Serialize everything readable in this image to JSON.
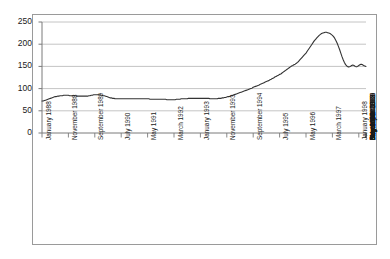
{
  "chart_data": {
    "type": "line",
    "title": "",
    "subtitle": "",
    "xlabel": "",
    "ylabel": "",
    "ylim": [
      0,
      250
    ],
    "yticks": [
      0,
      50,
      100,
      150,
      200,
      250
    ],
    "ytick_labels": [
      "0",
      "50",
      "100",
      "150",
      "200",
      "250"
    ],
    "grid": true,
    "grid_axis": "y",
    "legend": false,
    "legend_position": "none",
    "line_color": "#333333",
    "grid_color": "#b5b5b5",
    "axis_color": "#7a7a7a",
    "background_color": "#ffffff",
    "xtick_labels": [
      "January 1988",
      "November 1988",
      "September 1989",
      "July 1990",
      "May 1991",
      "March 1992",
      "January 1993",
      "November 1993",
      "September 1994",
      "July 1995",
      "May 1996",
      "March 1997",
      "January 1998",
      "November 1998",
      "September 1999",
      "July 2000",
      "May 2001",
      "March 2002",
      "January 2003",
      "November 2003",
      "September 2004",
      "July 2005",
      "May 2006",
      "March 2007",
      "January 2008",
      "November 2008",
      "September 2009",
      "July 2010"
    ],
    "xtick_interval_months": 22,
    "x_start": "January 1988",
    "x_end": "July 2010",
    "x_unit": "month",
    "n_points": 271,
    "values": [
      72,
      72,
      73,
      74,
      75,
      76,
      77,
      78,
      79,
      80,
      81,
      82,
      82,
      83,
      83,
      84,
      84,
      84,
      85,
      85,
      85,
      85,
      85,
      84,
      84,
      84,
      84,
      84,
      84,
      83,
      83,
      83,
      83,
      83,
      83,
      83,
      83,
      83,
      83,
      84,
      84,
      85,
      85,
      86,
      86,
      86,
      86,
      86,
      86,
      85,
      85,
      84,
      84,
      83,
      82,
      81,
      80,
      79,
      79,
      78,
      78,
      77,
      77,
      77,
      77,
      77,
      77,
      77,
      77,
      77,
      77,
      77,
      77,
      77,
      77,
      77,
      77,
      77,
      77,
      77,
      77,
      77,
      77,
      77,
      77,
      77,
      77,
      77,
      77,
      77,
      76,
      76,
      76,
      76,
      76,
      76,
      76,
      76,
      76,
      76,
      76,
      76,
      76,
      76,
      75,
      75,
      75,
      75,
      75,
      75,
      75,
      75,
      76,
      76,
      76,
      76,
      77,
      77,
      77,
      77,
      77,
      77,
      78,
      78,
      78,
      78,
      78,
      78,
      78,
      78,
      78,
      78,
      78,
      78,
      78,
      78,
      78,
      78,
      78,
      78,
      77,
      77,
      77,
      77,
      77,
      77,
      77,
      78,
      78,
      78,
      79,
      79,
      80,
      80,
      81,
      82,
      82,
      83,
      84,
      85,
      86,
      87,
      88,
      89,
      90,
      91,
      92,
      93,
      94,
      95,
      96,
      97,
      98,
      99,
      100,
      101,
      103,
      104,
      105,
      106,
      107,
      108,
      110,
      111,
      112,
      113,
      115,
      116,
      117,
      118,
      120,
      121,
      123,
      124,
      126,
      127,
      129,
      130,
      132,
      133,
      135,
      137,
      139,
      141,
      143,
      145,
      147,
      149,
      151,
      152,
      154,
      155,
      157,
      159,
      162,
      165,
      168,
      171,
      174,
      177,
      180,
      184,
      188,
      192,
      196,
      200,
      204,
      208,
      211,
      214,
      217,
      220,
      222,
      224,
      225,
      226,
      227,
      227,
      226,
      225,
      224,
      222,
      220,
      217,
      213,
      208,
      202,
      195,
      188,
      180,
      172,
      165,
      159,
      154,
      151,
      149,
      149,
      150,
      152,
      153,
      152,
      150,
      149,
      150,
      152,
      154,
      155,
      154,
      152,
      151,
      150
    ]
  }
}
